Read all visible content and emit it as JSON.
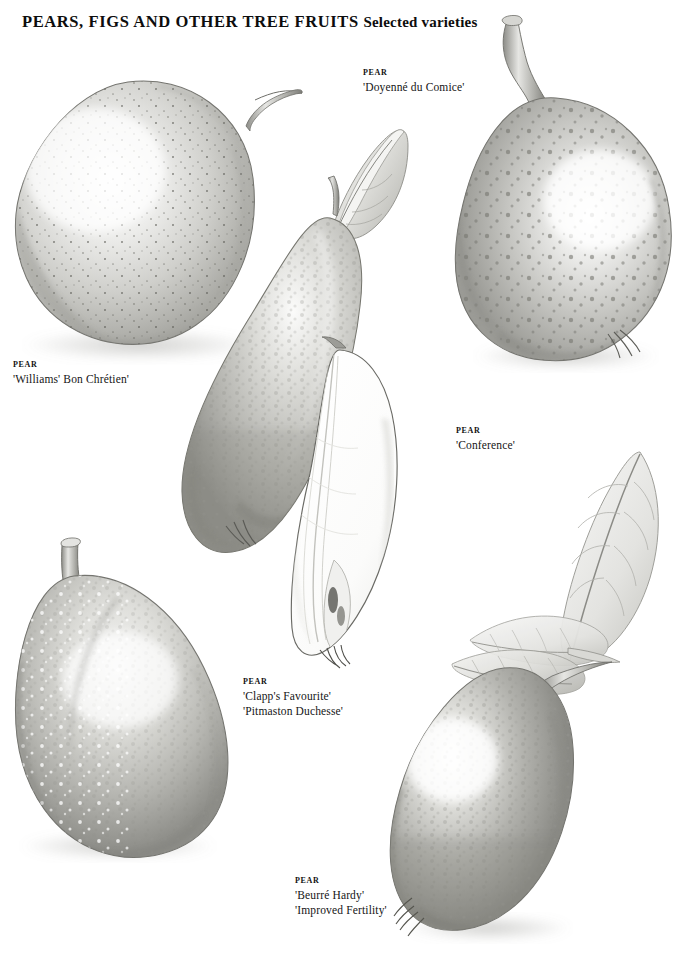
{
  "plate": {
    "title_main": "PEARS, FIGS AND OTHER TREE FRUITS",
    "title_sub": "Selected varieties",
    "background": "#ffffff",
    "ink": "#111111"
  },
  "captions": [
    {
      "id": "doyenne-du-comice",
      "kind": "PEAR",
      "cultivars": [
        "'Doyenné du Comice'"
      ],
      "x": 363,
      "y": 68
    },
    {
      "id": "williams-bon-chretien",
      "kind": "PEAR",
      "cultivars": [
        "'Williams' Bon Chrétien'"
      ],
      "x": 13,
      "y": 360
    },
    {
      "id": "conference",
      "kind": "PEAR",
      "cultivars": [
        "'Conference'"
      ],
      "x": 456,
      "y": 426
    },
    {
      "id": "clapps-favourite",
      "kind": "PEAR",
      "cultivars": [
        "'Clapp's Favourite'",
        "'Pitmaston Duchesse'"
      ],
      "x": 243,
      "y": 677
    },
    {
      "id": "beurre-hardy",
      "kind": "PEAR",
      "cultivars": [
        "'Beurré Hardy'",
        "'Improved Fertility'"
      ],
      "x": 295,
      "y": 876
    }
  ],
  "specimens": [
    {
      "id": "pear-williams-bon-chretien",
      "label": "whole pear, speckled, long curved stalk"
    },
    {
      "id": "pear-doyenne-du-comice",
      "label": "whole pear, heavily lenticel spotted, thick gnarled stalk"
    },
    {
      "id": "leaf-doyenne-du-comice",
      "label": "folded ovate leaf"
    },
    {
      "id": "pear-conference-whole",
      "label": "elongated russeted pear"
    },
    {
      "id": "pear-conference-section",
      "label": "longitudinal cut half showing core"
    },
    {
      "id": "pear-clapps-favourite",
      "label": "broad blunt pear with pale lenticels"
    },
    {
      "id": "pear-beurre-hardy",
      "label": "russeted pear tilted, leafy spur at stalk"
    },
    {
      "id": "leaf-beurre-hardy-large",
      "label": "large pinnate-veined leaf"
    },
    {
      "id": "leaf-beurre-hardy-spur",
      "label": "cluster of spur leaves"
    }
  ],
  "palette": {
    "skin_light": "#f2f2f1",
    "skin_mid": "#c9c9c6",
    "skin_dark": "#9a9a96",
    "skin_deep": "#7b7b77",
    "outline": "#6f6f6b",
    "speck": "#5a5a56",
    "flesh": "#fdfdfc",
    "leaf_light": "#ededea",
    "leaf_mid": "#c5c6c2"
  }
}
